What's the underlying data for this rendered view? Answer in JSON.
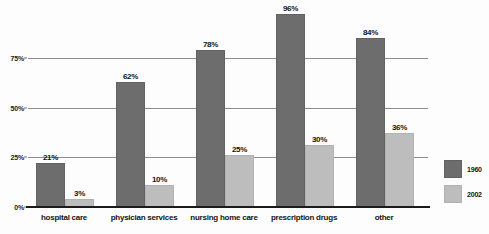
{
  "chart_data": {
    "type": "bar",
    "title": "",
    "xlabel": "",
    "ylabel": "",
    "categories": [
      "hospital care",
      "physician services",
      "nursing home care",
      "prescription drugs",
      "other"
    ],
    "series": [
      {
        "name": "1960",
        "color": "#6d6d6d",
        "values": [
          21,
          62,
          78,
          96,
          84
        ],
        "labels": [
          "21%",
          "62%",
          "78%",
          "96%",
          "84%"
        ]
      },
      {
        "name": "2002",
        "color": "#bdbdbd",
        "values": [
          3,
          10,
          25,
          30,
          36
        ],
        "labels": [
          "3%",
          "10%",
          "25%",
          "30%",
          "36%"
        ]
      }
    ],
    "ylim": [
      0,
      100
    ],
    "yticks": [
      0,
      25,
      50,
      75
    ],
    "ytick_labels": [
      "0%",
      "25%",
      "50%",
      "75%"
    ],
    "grid": true,
    "legend_position": "right"
  },
  "legend": {
    "entries": [
      {
        "label": "1960"
      },
      {
        "label": "2002"
      }
    ]
  }
}
